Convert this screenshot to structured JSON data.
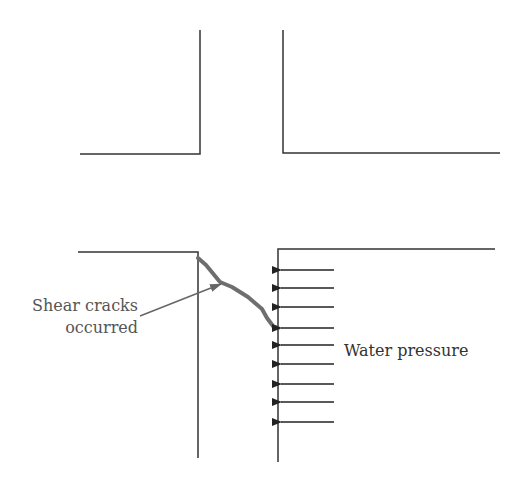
{
  "diagram": {
    "labels": {
      "crack_line1": "Shear cracks",
      "crack_line2": "occurred",
      "water_pressure": "Water pressure"
    },
    "colors": {
      "line": "#333333",
      "crack": "#6e6e6e",
      "label": "#555555"
    },
    "top_walls": {
      "left": {
        "vertical_x": 200,
        "y_top": 30,
        "y_corner": 154,
        "horizontal_from_x": 80
      },
      "right": {
        "vertical_x": 283,
        "y_top": 30,
        "y_corner": 153,
        "horizontal_to_x": 500
      }
    },
    "bottom_walls": {
      "left": {
        "vertical_x": 198,
        "y_top": 252,
        "y_bottom": 458,
        "horizontal_from_x": 78
      },
      "right": {
        "vertical_x": 278,
        "y_top": 249,
        "y_bottom": 462,
        "horizontal_to_x": 495
      }
    },
    "pressure_arrows_y": [
      270,
      288,
      307,
      328,
      345,
      364,
      384,
      402,
      422
    ],
    "arrow_count": 9
  }
}
